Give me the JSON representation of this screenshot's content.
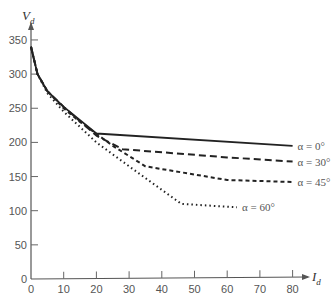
{
  "chart_data": {
    "type": "line",
    "title": "",
    "xlabel": "I_d",
    "ylabel": "V_d",
    "xlim": [
      0,
      80
    ],
    "ylim": [
      0,
      350
    ],
    "xticks": [
      0,
      10,
      20,
      30,
      40,
      50,
      60,
      70,
      80
    ],
    "yticks": [
      0,
      50,
      100,
      150,
      200,
      250,
      300,
      350
    ],
    "grid": false,
    "legend_position": "inline-right",
    "series": [
      {
        "name": "α = 0°",
        "style": "solid",
        "x": [
          0,
          2,
          5,
          10,
          20,
          80
        ],
        "y": [
          340,
          300,
          275,
          252,
          213,
          195
        ]
      },
      {
        "name": "α = 30°",
        "style": "dashed",
        "x": [
          0,
          2,
          5,
          10,
          20,
          28,
          60,
          80
        ],
        "y": [
          340,
          300,
          275,
          252,
          210,
          190,
          178,
          172
        ]
      },
      {
        "name": "α = 45°",
        "style": "short-dashed",
        "x": [
          0,
          2,
          5,
          10,
          15,
          25,
          35,
          60,
          80
        ],
        "y": [
          340,
          300,
          275,
          250,
          230,
          195,
          165,
          145,
          142
        ]
      },
      {
        "name": "α = 60°",
        "style": "dotted",
        "x": [
          0,
          2,
          5,
          10,
          20,
          30,
          46,
          63
        ],
        "y": [
          340,
          300,
          272,
          245,
          200,
          165,
          110,
          105
        ]
      }
    ]
  },
  "axes": {
    "x_title_main": "I",
    "x_title_sub": "d",
    "y_title_main": "V",
    "y_title_sub": "d"
  }
}
